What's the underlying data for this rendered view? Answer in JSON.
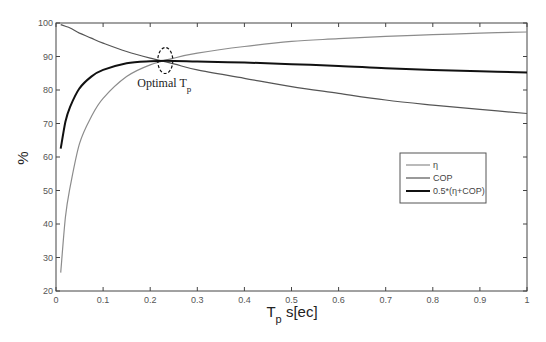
{
  "chart_data": {
    "type": "line",
    "title": "",
    "xlabel": "T_p s[ec]",
    "xlabel_main": "T",
    "xlabel_sub": "p",
    "xlabel_rest": " s[ec]",
    "ylabel": "%",
    "xlim": [
      0,
      1
    ],
    "ylim": [
      20,
      100
    ],
    "grid": false,
    "legend_position": "right, middle",
    "x_ticks": [
      "0",
      "0.1",
      "0.2",
      "0.3",
      "0.4",
      "0.5",
      "0.6",
      "0.7",
      "0.8",
      "0.9",
      "1"
    ],
    "y_ticks": [
      "20",
      "30",
      "40",
      "50",
      "60",
      "70",
      "80",
      "90",
      "100"
    ],
    "x": [
      0.01,
      0.02,
      0.03,
      0.05,
      0.075,
      0.1,
      0.15,
      0.2,
      0.25,
      0.3,
      0.4,
      0.5,
      0.6,
      0.7,
      0.8,
      0.9,
      1.0
    ],
    "series": [
      {
        "name": "η",
        "color": "#8c8c8c",
        "width": 1.2,
        "values": [
          25.5,
          42,
          51,
          64,
          72,
          77.5,
          84,
          87.5,
          89.5,
          91,
          93,
          94.5,
          95.3,
          96,
          96.5,
          97,
          97.3
        ]
      },
      {
        "name": "COP",
        "color": "#555555",
        "width": 1.2,
        "values": [
          99.5,
          99,
          98.5,
          97,
          95.5,
          94,
          91.5,
          89.5,
          87.8,
          86,
          83.5,
          81,
          79,
          77,
          75.5,
          74.2,
          73
        ]
      },
      {
        "name": "0.5*(η+COP)",
        "color": "#111111",
        "width": 2,
        "values": [
          62.5,
          70.5,
          75,
          80.5,
          84,
          86,
          88,
          88.6,
          88.7,
          88.5,
          88.2,
          87.7,
          87.2,
          86.5,
          86,
          85.6,
          85.2
        ]
      }
    ],
    "annotations": [
      {
        "text": "Optimal T",
        "subscript": "p",
        "type": "dashed-ellipse",
        "x": 0.232,
        "y": 88.8
      }
    ]
  }
}
